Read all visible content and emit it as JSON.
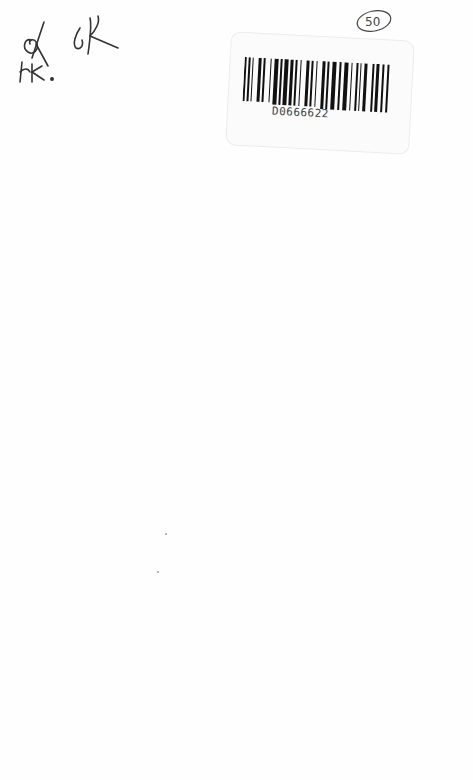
{
  "page": {
    "background": "#fefefe"
  },
  "handwriting": {
    "initials_top_left": "OK",
    "initials_second": "OK",
    "initials_below": "HK.",
    "circled_number": "50"
  },
  "barcode_label": {
    "number": "D0666622",
    "ink_color": "#111111"
  }
}
